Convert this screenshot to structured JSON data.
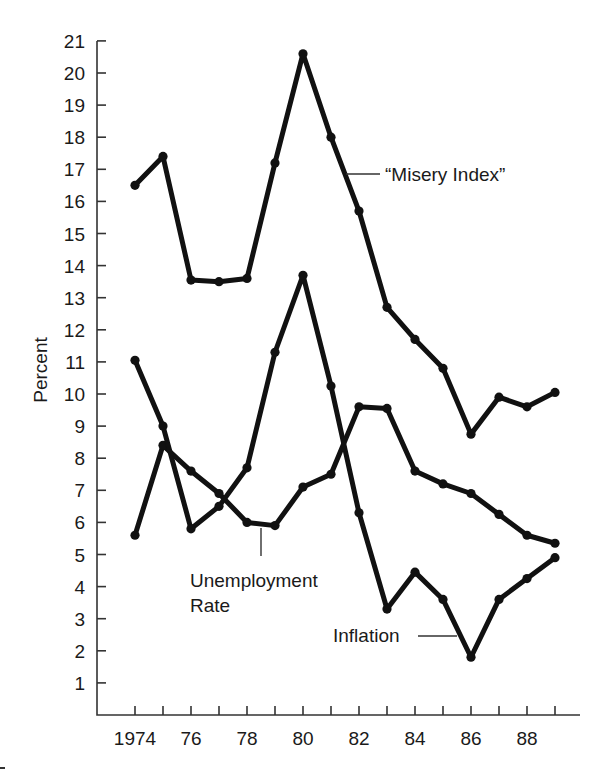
{
  "chart_data": {
    "type": "line",
    "title": "",
    "xlabel": "",
    "ylabel": "Percent",
    "x": [
      1974,
      1975,
      1976,
      1977,
      1978,
      1979,
      1980,
      1981,
      1982,
      1983,
      1984,
      1985,
      1986,
      1987,
      1988,
      1989
    ],
    "x_tick_labels": [
      {
        "year": 1974,
        "label": "1974"
      },
      {
        "year": 1976,
        "label": "76"
      },
      {
        "year": 1978,
        "label": "78"
      },
      {
        "year": 1980,
        "label": "80"
      },
      {
        "year": 1982,
        "label": "82"
      },
      {
        "year": 1984,
        "label": "84"
      },
      {
        "year": 1986,
        "label": "86"
      },
      {
        "year": 1988,
        "label": "88"
      }
    ],
    "y_ticks": [
      1,
      2,
      3,
      4,
      5,
      6,
      7,
      8,
      9,
      10,
      11,
      12,
      13,
      14,
      15,
      16,
      17,
      18,
      19,
      20,
      21
    ],
    "ylim": [
      0,
      21
    ],
    "xlim": [
      1972.6,
      1989.9
    ],
    "grid": false,
    "legend": "none (inline annotations)",
    "series": [
      {
        "name": "“Misery Index”",
        "values": [
          16.5,
          17.4,
          13.55,
          13.5,
          13.6,
          17.2,
          20.6,
          18.0,
          15.7,
          12.7,
          11.7,
          10.8,
          8.75,
          9.9,
          9.6,
          10.05
        ]
      },
      {
        "name": "Unemployment Rate",
        "values": [
          5.6,
          8.4,
          7.6,
          6.9,
          6.0,
          5.9,
          7.1,
          7.5,
          9.6,
          9.55,
          7.6,
          7.2,
          6.9,
          6.25,
          5.6,
          5.35
        ]
      },
      {
        "name": "Inflation",
        "values": [
          11.05,
          9.0,
          5.8,
          6.5,
          7.7,
          11.3,
          13.7,
          10.25,
          6.3,
          3.3,
          4.45,
          3.6,
          1.8,
          3.6,
          4.25,
          4.9
        ]
      }
    ],
    "annotations": [
      {
        "text": "“Misery Index”",
        "points_to": "Misery Index line near 1981"
      },
      {
        "text": "Unemployment",
        "text2": "Rate",
        "points_to": "Unemployment line near 1978-79"
      },
      {
        "text": "Inflation",
        "points_to": "Inflation line near 1985-86"
      }
    ]
  }
}
